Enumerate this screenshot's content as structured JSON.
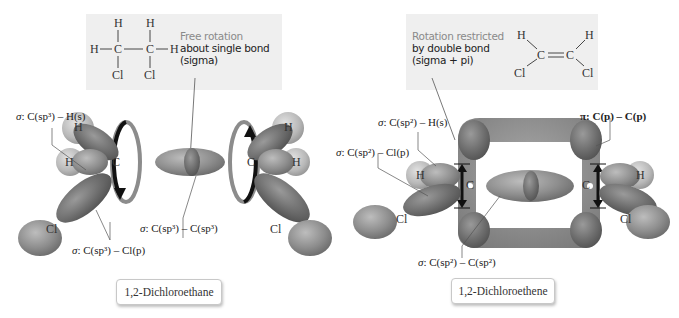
{
  "left_panel": {
    "molecule_name": "1,2-Dichloroethane",
    "callout": {
      "lead": "Free rotation",
      "line1": "about single bond",
      "line2": "(sigma)"
    },
    "structure": {
      "top_h1": "H",
      "top_h2": "H",
      "left_h": "H",
      "right_h": "H",
      "c1": "C",
      "c2": "C",
      "bond": "—",
      "cl1": "Cl",
      "cl2": "Cl"
    },
    "atoms": {
      "c_left": "C",
      "c_right": "C",
      "h_top_left": "H",
      "h_mid_left": "H",
      "h_top_right": "H",
      "h_mid_right": "H",
      "cl_left": "Cl",
      "cl_right": "Cl"
    },
    "bond_labels": {
      "ch": {
        "sigma": "σ",
        "text": ": C(sp³) – H(s)"
      },
      "ccl": {
        "sigma": "σ",
        "text": ": C(sp³) – Cl(p)"
      },
      "cc": {
        "sigma": "σ",
        "text": ": C(sp³) – C(sp³)"
      }
    }
  },
  "right_panel": {
    "molecule_name": "1,2-Dichloroethene",
    "callout": {
      "lead": "Rotation restricted",
      "line1": "by double bond",
      "line2": "(sigma + pi)"
    },
    "structure": {
      "h_left": "H",
      "h_right": "H",
      "c1": "C",
      "c2": "C",
      "double_bond": "=",
      "cl_left": "Cl",
      "cl_right": "Cl"
    },
    "atoms": {
      "c_left": "C",
      "c_right": "C",
      "h_left": "H",
      "h_right": "H",
      "cl_left": "Cl",
      "cl_right": "Cl"
    },
    "bond_labels": {
      "ch": {
        "sigma": "σ",
        "text": ": C(sp²) – H(s)"
      },
      "ccl": {
        "sigma": "σ",
        "text": ": C(sp²) – Cl(p)"
      },
      "cc": {
        "sigma": "σ",
        "text": ": C(sp²) – C(sp²)"
      },
      "pi": {
        "pi": "π",
        "text": ": C(p) – C(p)"
      }
    }
  },
  "colors": {
    "callout_bg": "#efefef",
    "lobe_light": "#9a9a9a",
    "lobe_dark": "#6e6e6e",
    "h_sphere": "#bdbdbd",
    "ring_gray": "#8c8c8c",
    "arrow_black": "#111111"
  }
}
